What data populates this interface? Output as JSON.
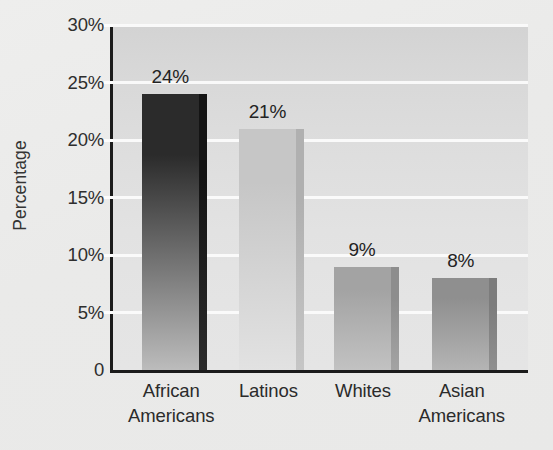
{
  "chart_data": {
    "type": "bar",
    "title": "",
    "subtitle": "",
    "xlabel": "",
    "ylabel": "Percentage",
    "categories": [
      "African Americans",
      "Latinos",
      "Whites",
      "Asian Americans"
    ],
    "category_lines": [
      [
        "African",
        "Americans"
      ],
      [
        "Latinos",
        ""
      ],
      [
        "Whites",
        ""
      ],
      [
        "Asian",
        "Americans"
      ]
    ],
    "values": [
      24,
      21,
      9,
      8
    ],
    "value_labels": [
      "24%",
      "21%",
      "9%",
      "8%"
    ],
    "ylim": [
      0,
      30
    ],
    "ytick_values": [
      0,
      5,
      10,
      15,
      20,
      25,
      30
    ],
    "ytick_labels": [
      "0",
      "5%",
      "10%",
      "15%",
      "20%",
      "25%",
      "30%"
    ],
    "grid": true,
    "grid_color": "#fbfbfb",
    "legend": "none",
    "bar_colors": [
      "#2b2b2b",
      "#c6c6c6",
      "#a3a3a3",
      "#8f8f8f"
    ],
    "bar_colors_bottom": [
      "#bcbcbc",
      "#e2e2e2",
      "#c2c2c2",
      "#b4b4b4"
    ],
    "bar_side_colors": [
      "#141414",
      "#b0b0b0",
      "#8d8d8d",
      "#7c7c7c"
    ],
    "axis_color": "#1b1b1b",
    "plot_background": "#dddddd",
    "figure_background": "#ebebea"
  }
}
